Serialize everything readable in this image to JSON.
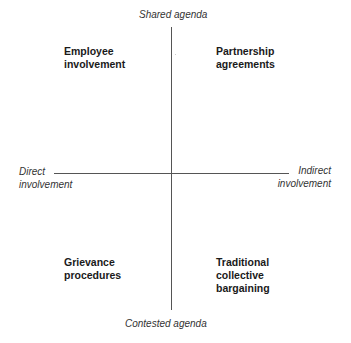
{
  "diagram": {
    "type": "quadrant",
    "axes": {
      "vertical": {
        "top_label": "Shared agenda",
        "bottom_label": "Contested agenda"
      },
      "horizontal": {
        "left_label_line1": "Direct",
        "left_label_line2": "involvement",
        "right_label_line1": "Indirect",
        "right_label_line2": "involvement"
      }
    },
    "quadrants": {
      "top_left": "Employee\ninvolvement",
      "top_right": "Partnership\nagreements",
      "bottom_left": "Grievance\nprocedures",
      "bottom_right": "Traditional\ncollective\nbargaining"
    },
    "colors": {
      "axis_line": "#555555",
      "axis_label": "#333333",
      "quadrant_label": "#1a1a1a",
      "background": "#ffffff"
    }
  }
}
